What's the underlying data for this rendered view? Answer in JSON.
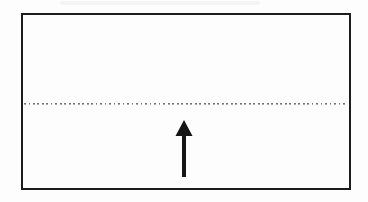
{
  "colors": {
    "background": "#fdfdfd",
    "frame_ink": "#1c1c1c",
    "dot_ink": "#4f4f4f",
    "arrow_ink": "#151515"
  },
  "elements": {
    "frame": {
      "name": "rectangle-frame",
      "shape": "rectangle",
      "stroke_px": 2
    },
    "dotted_line": {
      "name": "dotted-horizontal-line",
      "style": "dotted",
      "orientation": "horizontal"
    },
    "arrow": {
      "name": "up-arrow",
      "direction": "up"
    }
  }
}
